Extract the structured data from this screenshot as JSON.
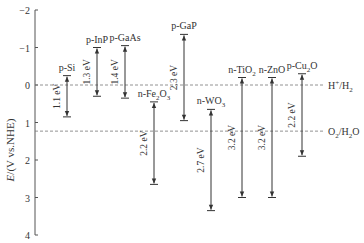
{
  "chart_data": {
    "type": "range-bar",
    "title": "",
    "ylabel": "E/(V vs.NHE)",
    "xlabel": "",
    "ylim": [
      -2,
      4
    ],
    "y_inverted": true,
    "yticks": [
      -2,
      -1,
      0,
      1,
      2,
      3,
      4
    ],
    "grid": false,
    "series": [
      {
        "name": "p-Si",
        "sub": "",
        "cb": -0.25,
        "vb": 0.85,
        "gap_label": "1.1 eV",
        "x": 67
      },
      {
        "name": "p-InP",
        "sub": "",
        "cb": -1.0,
        "vb": 0.3,
        "gap_label": "1.3 eV",
        "x": 97
      },
      {
        "name": "p-GaAs",
        "sub": "",
        "cb": -1.05,
        "vb": 0.35,
        "gap_label": "1.4 eV",
        "x": 125
      },
      {
        "name": "n-Fe",
        "sub": "2",
        "after": "O",
        "sub2": "3",
        "cb": 0.45,
        "vb": 2.65,
        "gap_label": "2.2 eV",
        "x": 154
      },
      {
        "name": "p-GaP",
        "sub": "",
        "cb": -1.35,
        "vb": 0.95,
        "gap_label": "2.3 eV",
        "x": 184
      },
      {
        "name": "n-WO",
        "sub": "3",
        "cb": 0.65,
        "vb": 3.35,
        "gap_label": "2.7 eV",
        "x": 211
      },
      {
        "name": "n-TiO",
        "sub": "2",
        "cb": -0.2,
        "vb": 3.0,
        "gap_label": "3.2 eV",
        "x": 242
      },
      {
        "name": "n-ZnO",
        "sub": "",
        "cb": -0.2,
        "vb": 3.0,
        "gap_label": "3.2 eV",
        "x": 272
      },
      {
        "name": "p-Cu",
        "sub": "2",
        "after": "O",
        "cb": -0.3,
        "vb": 1.9,
        "gap_label": "2.2 eV",
        "x": 302
      }
    ],
    "reference_lines": [
      {
        "label": "H+/H2",
        "value": 0
      },
      {
        "label": "O2/H2O",
        "value": 1.23
      }
    ]
  },
  "labels": {
    "ylabel_italic": "E",
    "ylabel_rest": "/(V vs.NHE)",
    "ref_h": "H",
    "ref_h_sup": "+",
    "ref_h_tail": "/H",
    "ref_h_sub": "2",
    "ref_o": "O",
    "ref_o_sub": "2",
    "ref_o_tail": "/H",
    "ref_o_sub2": "2",
    "ref_o_end": "O"
  }
}
